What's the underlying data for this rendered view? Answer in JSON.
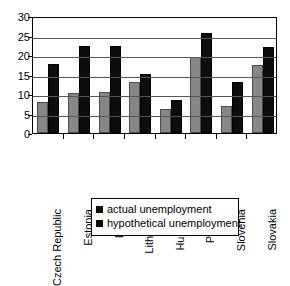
{
  "chart_data": {
    "type": "bar",
    "title": "",
    "xlabel": "",
    "ylabel": "",
    "ylim": [
      0,
      30
    ],
    "yticks": [
      0,
      5,
      10,
      15,
      20,
      25,
      30
    ],
    "grid": true,
    "legend_position": "bottom",
    "categories": [
      "Czech Republic",
      "Estonia",
      "Latvia",
      "Lithuania",
      "Hungary",
      "Poland",
      "Slovenia",
      "Slovakia"
    ],
    "series": [
      {
        "name": "actual unemployment",
        "color": "#878787",
        "values": [
          8.0,
          10.3,
          10.6,
          13.0,
          6.2,
          19.5,
          7.0,
          17.5
        ]
      },
      {
        "name": "hypothetical unemployment",
        "color": "#0d0d0d",
        "values": [
          17.7,
          22.4,
          22.4,
          15.2,
          8.4,
          25.6,
          13.0,
          22.0
        ]
      }
    ]
  },
  "legend": {
    "items": [
      {
        "label": "actual unemployment",
        "color": "#0d0d0d"
      },
      {
        "label": "hypothetical unemployment",
        "color": "#0d0d0d"
      }
    ]
  }
}
